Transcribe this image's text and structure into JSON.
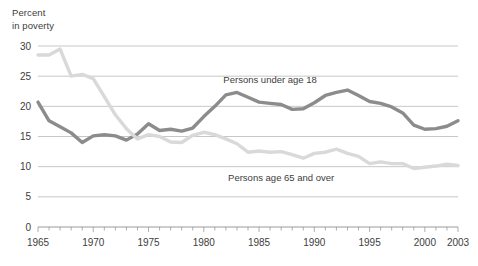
{
  "chart_data": {
    "type": "line",
    "title": "",
    "ylabel": "Percent\nin poverty",
    "xlabel": "",
    "ylim": [
      0,
      30
    ],
    "xlim": [
      1965,
      2003
    ],
    "grid": true,
    "legend_position": "inline-annotation",
    "ytick_labels": [
      "0",
      "5",
      "10",
      "15",
      "20",
      "25",
      "30"
    ],
    "ytick_values": [
      0,
      5,
      10,
      15,
      20,
      25,
      30
    ],
    "xtick_labels": [
      "1965",
      "1970",
      "1975",
      "1980",
      "1985",
      "1990",
      "1995",
      "2000",
      "2003"
    ],
    "xtick_values": [
      1965,
      1970,
      1975,
      1980,
      1985,
      1990,
      1995,
      2000,
      2003
    ],
    "x": [
      1965,
      1966,
      1967,
      1968,
      1969,
      1970,
      1971,
      1972,
      1973,
      1974,
      1975,
      1976,
      1977,
      1978,
      1979,
      1980,
      1981,
      1982,
      1983,
      1984,
      1985,
      1986,
      1987,
      1988,
      1989,
      1990,
      1991,
      1992,
      1993,
      1994,
      1995,
      1996,
      1997,
      1998,
      1999,
      2000,
      2001,
      2002,
      2003
    ],
    "series": [
      {
        "name": "Persons under age 18",
        "color": "#8c8c8c",
        "label_x": 1986,
        "label_y": 23.8,
        "values": [
          20.7,
          17.6,
          16.6,
          15.6,
          14.0,
          15.1,
          15.3,
          15.1,
          14.4,
          15.4,
          17.1,
          16.0,
          16.2,
          15.9,
          16.4,
          18.3,
          20.0,
          21.9,
          22.3,
          21.5,
          20.7,
          20.5,
          20.3,
          19.5,
          19.6,
          20.6,
          21.8,
          22.3,
          22.7,
          21.8,
          20.8,
          20.5,
          19.9,
          18.9,
          16.9,
          16.2,
          16.3,
          16.7,
          17.6
        ]
      },
      {
        "name": "Persons age 65 and over",
        "color": "#d9d9d9",
        "label_x": 1987,
        "label_y": 7.6,
        "values": [
          28.5,
          28.5,
          29.5,
          25.0,
          25.3,
          24.6,
          21.6,
          18.6,
          16.3,
          14.6,
          15.3,
          15.0,
          14.1,
          14.0,
          15.2,
          15.7,
          15.3,
          14.6,
          13.8,
          12.4,
          12.6,
          12.4,
          12.5,
          12.0,
          11.4,
          12.2,
          12.4,
          12.9,
          12.2,
          11.7,
          10.5,
          10.8,
          10.5,
          10.5,
          9.7,
          9.9,
          10.1,
          10.4,
          10.2
        ]
      }
    ]
  }
}
